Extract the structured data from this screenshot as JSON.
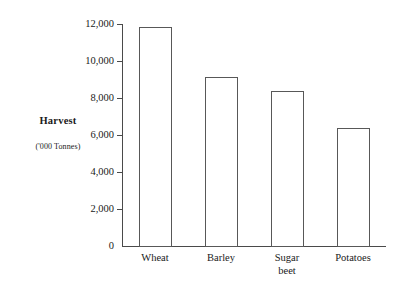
{
  "chart_data": {
    "type": "bar",
    "title": "",
    "subtitle": "",
    "xlabel": "",
    "ylabel": "Harvest",
    "ylabel_sub": "('000 Tonnes)",
    "categories": [
      "Wheat",
      "Barley",
      "Sugar beet",
      "Potatoes"
    ],
    "values": [
      11850,
      9150,
      8380,
      6380
    ],
    "ylim": [
      0,
      12000
    ],
    "yticks": [
      0,
      2000,
      4000,
      6000,
      8000,
      10000,
      12000
    ],
    "ytick_labels": [
      "0",
      "2,000",
      "4,000",
      "6,000",
      "8,000",
      "10,000",
      "12,000"
    ],
    "grid": false,
    "legend": false,
    "legend_position": "none",
    "series": [
      {
        "name": "Harvest",
        "values": [
          11850,
          9150,
          8380,
          6380
        ]
      }
    ],
    "colors": {
      "bar_fill": "#ffffff",
      "bar_stroke": "#585858",
      "axis": "#4a4a4a",
      "text": "#1a1a1a",
      "background": "#ffffff"
    }
  },
  "axis_title": {
    "main": "Harvest",
    "sub": "('000 Tonnes)"
  }
}
